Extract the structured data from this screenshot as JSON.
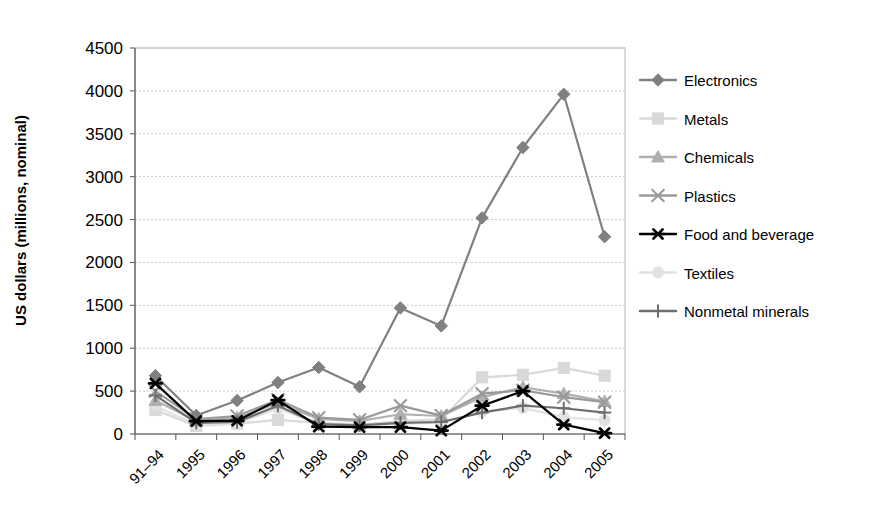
{
  "chart_data": {
    "type": "line",
    "title": "",
    "xlabel": "",
    "ylabel": "US dollars (millions, nominal)",
    "categories": [
      "91–94",
      "1995",
      "1996",
      "1997",
      "1998",
      "1999",
      "2000",
      "2001",
      "2002",
      "2003",
      "2004",
      "2005"
    ],
    "ylim": [
      0,
      4500
    ],
    "ytick_labels": [
      "0",
      "500",
      "1000",
      "1500",
      "2000",
      "2500",
      "3000",
      "3500",
      "4000",
      "4500"
    ],
    "ytick_values": [
      0,
      500,
      1000,
      1500,
      2000,
      2500,
      3000,
      3500,
      4000,
      4500
    ],
    "grid": true,
    "legend_position": "right",
    "series": [
      {
        "name": "Electronics",
        "marker": "diamond",
        "color": "#808080",
        "values": [
          680,
          215,
          390,
          600,
          775,
          550,
          1470,
          1260,
          2520,
          3340,
          3960,
          2300
        ]
      },
      {
        "name": "Metals",
        "marker": "square",
        "color": "#d9d9d9",
        "values": [
          280,
          95,
          120,
          165,
          130,
          110,
          150,
          170,
          660,
          690,
          770,
          680
        ]
      },
      {
        "name": "Chemicals",
        "marker": "triangle",
        "color": "#b0b0b0",
        "values": [
          390,
          150,
          190,
          360,
          175,
          150,
          230,
          210,
          430,
          545,
          470,
          380
        ]
      },
      {
        "name": "Plastics",
        "marker": "cross-x",
        "color": "#9a9a9a",
        "values": [
          500,
          175,
          210,
          400,
          190,
          165,
          330,
          215,
          470,
          510,
          430,
          370
        ]
      },
      {
        "name": "Food and beverage",
        "marker": "asterisk",
        "color": "#000000",
        "values": [
          590,
          150,
          155,
          395,
          85,
          80,
          80,
          40,
          330,
          500,
          110,
          10
        ]
      },
      {
        "name": "Textiles",
        "marker": "circle",
        "color": "#e2e2e2",
        "values": [
          330,
          105,
          120,
          300,
          110,
          95,
          120,
          130,
          260,
          305,
          195,
          160
        ]
      },
      {
        "name": "Nonmetal minerals",
        "marker": "plus",
        "color": "#6e6e6e",
        "values": [
          450,
          130,
          140,
          330,
          115,
          100,
          130,
          140,
          250,
          330,
          300,
          250
        ]
      }
    ]
  }
}
